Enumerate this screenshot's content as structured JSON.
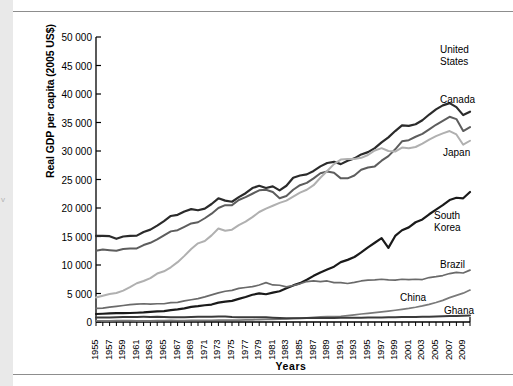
{
  "page": {
    "edge_mark": "v"
  },
  "chart_data": {
    "type": "line",
    "title": "",
    "xlabel": "Years",
    "ylabel": "Real GDP per capita (2005 US$)",
    "xlim": [
      1955,
      2010
    ],
    "ylim": [
      0,
      50000
    ],
    "grid": false,
    "legend_position": "right-inline-labels",
    "ytick_labels": [
      "0",
      "5 000",
      "10 000",
      "15 000",
      "20 000",
      "25 000",
      "30 000",
      "35 000",
      "40 000",
      "45 000",
      "50 000"
    ],
    "ytick_values": [
      0,
      5000,
      10000,
      15000,
      20000,
      25000,
      30000,
      35000,
      40000,
      45000,
      50000
    ],
    "xtick_labels": [
      "1955",
      "1957",
      "1959",
      "1961",
      "1963",
      "1965",
      "1967",
      "1969",
      "1971",
      "1973",
      "1975",
      "1977",
      "1979",
      "1981",
      "1983",
      "1985",
      "1987",
      "1989",
      "1991",
      "1993",
      "1995",
      "1997",
      "1999",
      "2001",
      "2003",
      "2005",
      "2007",
      "2009"
    ],
    "xtick_values": [
      1955,
      1957,
      1959,
      1961,
      1963,
      1965,
      1967,
      1969,
      1971,
      1973,
      1975,
      1977,
      1979,
      1981,
      1983,
      1985,
      1987,
      1989,
      1991,
      1993,
      1995,
      1997,
      1999,
      2001,
      2003,
      2005,
      2007,
      2009
    ],
    "x": [
      1955,
      1956,
      1957,
      1958,
      1959,
      1960,
      1961,
      1962,
      1963,
      1964,
      1965,
      1966,
      1967,
      1968,
      1969,
      1970,
      1971,
      1972,
      1973,
      1974,
      1975,
      1976,
      1977,
      1978,
      1979,
      1980,
      1981,
      1982,
      1983,
      1984,
      1985,
      1986,
      1987,
      1988,
      1989,
      1990,
      1991,
      1992,
      1993,
      1994,
      1995,
      1996,
      1997,
      1998,
      1999,
      2000,
      2001,
      2002,
      2003,
      2004,
      2005,
      2006,
      2007,
      2008,
      2009,
      2010
    ],
    "series": [
      {
        "name": "United States",
        "label": "United\nStates",
        "color": "#2b2b2b",
        "values": [
          15100,
          15100,
          15050,
          14600,
          15000,
          15100,
          15150,
          15800,
          16200,
          16900,
          17700,
          18600,
          18800,
          19400,
          19800,
          19600,
          19900,
          20700,
          21700,
          21300,
          21100,
          21900,
          22600,
          23500,
          23900,
          23500,
          23800,
          23100,
          23900,
          25300,
          25700,
          25900,
          26500,
          27300,
          27900,
          28100,
          27700,
          28300,
          28700,
          29400,
          29800,
          30500,
          31500,
          32400,
          33500,
          34500,
          34400,
          34700,
          35400,
          36400,
          37300,
          38000,
          38400,
          37700,
          36300,
          36900
        ]
      },
      {
        "name": "Canada",
        "label": "Canada",
        "color": "#5d5d5d",
        "values": [
          12500,
          12700,
          12600,
          12500,
          12800,
          12900,
          12900,
          13500,
          13900,
          14500,
          15200,
          15900,
          16100,
          16700,
          17300,
          17500,
          18200,
          19000,
          20000,
          20500,
          20500,
          21400,
          21900,
          22500,
          23100,
          23200,
          22800,
          21700,
          22100,
          23200,
          24000,
          24400,
          25200,
          26100,
          26400,
          26200,
          25200,
          25200,
          25700,
          26700,
          27100,
          27300,
          28300,
          29100,
          30300,
          31700,
          31900,
          32500,
          33000,
          33800,
          34600,
          35300,
          36000,
          35600,
          33500,
          34200
        ]
      },
      {
        "name": "Japan",
        "label": "Japan",
        "color": "#b0b0b0",
        "values": [
          4300,
          4600,
          4900,
          5100,
          5500,
          6100,
          6800,
          7200,
          7700,
          8500,
          8900,
          9600,
          10500,
          11600,
          12800,
          13800,
          14200,
          15200,
          16400,
          16000,
          16200,
          17000,
          17600,
          18400,
          19300,
          19900,
          20400,
          20900,
          21300,
          22000,
          22700,
          23200,
          24000,
          25300,
          26500,
          27700,
          28500,
          28600,
          28600,
          28800,
          29300,
          30100,
          30500,
          30000,
          29900,
          30600,
          30500,
          30700,
          31300,
          32000,
          32600,
          33100,
          33500,
          32900,
          31100,
          31800
        ]
      },
      {
        "name": "South Korea",
        "label": "South\nKorea",
        "color": "#1a1a1a",
        "values": [
          1400,
          1450,
          1500,
          1550,
          1560,
          1580,
          1620,
          1680,
          1780,
          1850,
          1920,
          2080,
          2200,
          2390,
          2650,
          2780,
          2940,
          3060,
          3400,
          3560,
          3700,
          4050,
          4380,
          4780,
          5020,
          4870,
          5150,
          5400,
          5920,
          6420,
          6820,
          7400,
          8100,
          8700,
          9200,
          9700,
          10500,
          10900,
          11400,
          12200,
          13100,
          13900,
          14700,
          13000,
          15100,
          16100,
          16600,
          17500,
          18000,
          18900,
          19700,
          20500,
          21400,
          21800,
          21700,
          22800
        ]
      },
      {
        "name": "Brazil",
        "label": "Brazil",
        "color": "#6a6a6a",
        "values": [
          2400,
          2450,
          2600,
          2750,
          2900,
          3050,
          3150,
          3200,
          3150,
          3200,
          3200,
          3400,
          3450,
          3700,
          3900,
          4100,
          4400,
          4750,
          5100,
          5400,
          5550,
          5900,
          6050,
          6200,
          6500,
          6900,
          6500,
          6450,
          6150,
          6400,
          6700,
          7100,
          7200,
          7100,
          7200,
          6900,
          6900,
          6750,
          6950,
          7200,
          7350,
          7400,
          7500,
          7400,
          7350,
          7500,
          7450,
          7500,
          7450,
          7800,
          7950,
          8150,
          8500,
          8700,
          8600,
          9100
        ]
      },
      {
        "name": "China",
        "label": "China",
        "color": "#7a7a7a",
        "values": [
          190,
          200,
          210,
          230,
          230,
          230,
          190,
          190,
          210,
          240,
          260,
          270,
          260,
          250,
          270,
          300,
          310,
          310,
          330,
          330,
          350,
          340,
          360,
          390,
          420,
          450,
          470,
          500,
          540,
          620,
          690,
          740,
          810,
          890,
          930,
          960,
          1010,
          1130,
          1260,
          1400,
          1530,
          1660,
          1790,
          1920,
          2060,
          2220,
          2390,
          2590,
          2830,
          3100,
          3420,
          3800,
          4280,
          4670,
          5060,
          5600
        ]
      },
      {
        "name": "Ghana",
        "label": "Ghana",
        "color": "#3a3a3a",
        "values": [
          790,
          800,
          810,
          830,
          860,
          880,
          890,
          900,
          890,
          910,
          880,
          850,
          840,
          850,
          880,
          930,
          940,
          930,
          950,
          970,
          880,
          840,
          830,
          850,
          840,
          820,
          760,
          690,
          640,
          660,
          670,
          680,
          690,
          700,
          710,
          720,
          730,
          740,
          750,
          760,
          770,
          790,
          810,
          820,
          840,
          860,
          870,
          890,
          910,
          940,
          970,
          1000,
          1040,
          1070,
          1090,
          1130
        ]
      }
    ],
    "series_label_positions": [
      {
        "name": "United States",
        "left": 440,
        "top": 44
      },
      {
        "name": "Canada",
        "left": 440,
        "top": 94
      },
      {
        "name": "Japan",
        "left": 443,
        "top": 147
      },
      {
        "name": "South Korea",
        "left": 434,
        "top": 210
      },
      {
        "name": "Brazil",
        "left": 440,
        "top": 259
      },
      {
        "name": "China",
        "left": 400,
        "top": 292
      },
      {
        "name": "Ghana",
        "left": 444,
        "top": 305
      }
    ]
  }
}
